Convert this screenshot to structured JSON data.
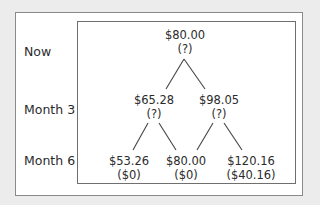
{
  "diagram": {
    "type": "binomial-tree",
    "row_labels": [
      "Now",
      "Month 3",
      "Month 6"
    ],
    "nodes": {
      "root": {
        "price": "$80.00",
        "value": "(?)"
      },
      "up3": {
        "price": "$98.05",
        "value": "(?)"
      },
      "down3": {
        "price": "$65.28",
        "value": "(?)"
      },
      "dd6": {
        "price": "$53.26",
        "value": "($0)"
      },
      "ud6": {
        "price": "$80.00",
        "value": "($0)"
      },
      "uu6": {
        "price": "$120.16",
        "value": "($40.16)"
      }
    },
    "edges": [
      [
        "root",
        "down3"
      ],
      [
        "root",
        "up3"
      ],
      [
        "down3",
        "dd6"
      ],
      [
        "down3",
        "ud6"
      ],
      [
        "up3",
        "ud6"
      ],
      [
        "up3",
        "uu6"
      ]
    ],
    "colors": {
      "background": "#ececec",
      "panel": "#ffffff",
      "border": "#8a8a8a",
      "line": "#444444",
      "text": "#2b2b2b"
    }
  }
}
